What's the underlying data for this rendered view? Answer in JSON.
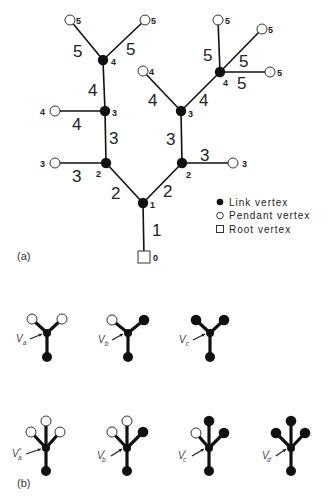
{
  "panel_a": {
    "label": "(a)",
    "legend": [
      {
        "marker": "link-vertex",
        "text": "Link vertex"
      },
      {
        "marker": "pendant-vertex",
        "text": "Pendant vertex"
      },
      {
        "marker": "root-vertex",
        "text": "Root vertex"
      }
    ],
    "vertices": [
      {
        "id": "root",
        "type": "root",
        "x": 144,
        "y": 257,
        "label": "0",
        "lx": 153,
        "ly": 261
      },
      {
        "id": "L1",
        "type": "link",
        "x": 143,
        "y": 203,
        "label": "1",
        "lx": 150,
        "ly": 208
      },
      {
        "id": "L2a",
        "type": "link",
        "x": 106,
        "y": 163,
        "label": "2",
        "lx": 96,
        "ly": 177
      },
      {
        "id": "L2b",
        "type": "link",
        "x": 182,
        "y": 163,
        "label": "2",
        "lx": 186,
        "ly": 178
      },
      {
        "id": "L3a",
        "type": "link",
        "x": 105,
        "y": 111,
        "label": "3",
        "lx": 112,
        "ly": 116
      },
      {
        "id": "L3b",
        "type": "link",
        "x": 181,
        "y": 111,
        "label": "3",
        "lx": 188,
        "ly": 117
      },
      {
        "id": "L4a",
        "type": "link",
        "x": 103,
        "y": 60,
        "label": "4",
        "lx": 111,
        "ly": 65
      },
      {
        "id": "L4b",
        "type": "link",
        "x": 220,
        "y": 72,
        "label": "4",
        "lx": 223,
        "ly": 86
      },
      {
        "id": "P3a",
        "type": "pendant",
        "x": 55,
        "y": 163,
        "label": "3",
        "lx": 40,
        "ly": 167
      },
      {
        "id": "P3b",
        "type": "pendant",
        "x": 233,
        "y": 163,
        "label": "3",
        "lx": 242,
        "ly": 167
      },
      {
        "id": "P4a",
        "type": "pendant",
        "x": 55,
        "y": 111,
        "label": "4",
        "lx": 40,
        "ly": 115
      },
      {
        "id": "P4b",
        "type": "pendant",
        "x": 143,
        "y": 71,
        "label": "4",
        "lx": 149,
        "ly": 75
      },
      {
        "id": "P5a",
        "type": "pendant",
        "x": 70,
        "y": 20,
        "label": "5",
        "lx": 76,
        "ly": 24
      },
      {
        "id": "P5b",
        "type": "pendant",
        "x": 145,
        "y": 20,
        "label": "5",
        "lx": 151,
        "ly": 24
      },
      {
        "id": "P5c",
        "type": "pendant",
        "x": 218,
        "y": 20,
        "label": "5",
        "lx": 225,
        "ly": 24
      },
      {
        "id": "P5d",
        "type": "pendant",
        "x": 262,
        "y": 29,
        "label": "5",
        "lx": 268,
        "ly": 33
      },
      {
        "id": "P5e",
        "type": "pendant",
        "x": 270,
        "y": 72,
        "label": "5",
        "lx": 277,
        "ly": 76
      }
    ],
    "edges": [
      {
        "from": "root",
        "to": "L1",
        "label": "1",
        "lx": 152,
        "ly": 236
      },
      {
        "from": "L1",
        "to": "L2a",
        "label": "2",
        "lx": 111,
        "ly": 199
      },
      {
        "from": "L1",
        "to": "L2b",
        "label": "2",
        "lx": 163,
        "ly": 197
      },
      {
        "from": "L2a",
        "to": "P3a",
        "label": "3",
        "lx": 72,
        "ly": 182
      },
      {
        "from": "L2a",
        "to": "L3a",
        "label": "3",
        "lx": 109,
        "ly": 144
      },
      {
        "from": "L2b",
        "to": "L3b",
        "label": "3",
        "lx": 166,
        "ly": 145
      },
      {
        "from": "L2b",
        "to": "P3b",
        "label": "3",
        "lx": 200,
        "ly": 161
      },
      {
        "from": "L3a",
        "to": "P4a",
        "label": "4",
        "lx": 72,
        "ly": 130
      },
      {
        "from": "L3a",
        "to": "L4a",
        "label": "4",
        "lx": 88,
        "ly": 96
      },
      {
        "from": "L3b",
        "to": "P4b",
        "label": "4",
        "lx": 148,
        "ly": 106
      },
      {
        "from": "L3b",
        "to": "L4b",
        "label": "4",
        "lx": 199,
        "ly": 106
      },
      {
        "from": "L4a",
        "to": "P5a",
        "label": "5",
        "lx": 73,
        "ly": 57
      },
      {
        "from": "L4a",
        "to": "P5b",
        "label": "5",
        "lx": 126,
        "ly": 55
      },
      {
        "from": "L4b",
        "to": "P5c",
        "label": "5",
        "lx": 203,
        "ly": 61
      },
      {
        "from": "L4b",
        "to": "P5d",
        "label": "5",
        "lx": 239,
        "ly": 67
      },
      {
        "from": "L4b",
        "to": "P5e",
        "label": "5",
        "lx": 237,
        "ly": 89
      }
    ]
  },
  "panel_b": {
    "label": "(b)",
    "motifs": [
      {
        "name": "V",
        "sub": "a",
        "prime": "",
        "cx": 47,
        "cy": 333,
        "bottom": 357,
        "lblx": 16,
        "lbly": 342,
        "branches": [
          {
            "x": 32,
            "y": 319,
            "type": "pendant"
          },
          {
            "x": 62,
            "y": 319,
            "type": "pendant"
          }
        ]
      },
      {
        "name": "V",
        "sub": "b",
        "prime": "",
        "cx": 128,
        "cy": 333,
        "bottom": 357,
        "lblx": 98,
        "lbly": 343,
        "branches": [
          {
            "x": 112,
            "y": 320,
            "type": "pendant"
          },
          {
            "x": 144,
            "y": 320,
            "type": "link"
          }
        ]
      },
      {
        "name": "V",
        "sub": "c",
        "prime": "",
        "cx": 210,
        "cy": 333,
        "bottom": 357,
        "lblx": 179,
        "lbly": 343,
        "branches": [
          {
            "x": 196,
            "y": 320,
            "type": "link"
          },
          {
            "x": 224,
            "y": 320,
            "type": "link"
          }
        ]
      },
      {
        "name": "V",
        "sub": "a",
        "prime": "″",
        "cx": 46,
        "cy": 448,
        "bottom": 471,
        "lblx": 12,
        "lbly": 457,
        "branches": [
          {
            "x": 31,
            "y": 432,
            "type": "pendant"
          },
          {
            "x": 46,
            "y": 421,
            "type": "pendant"
          },
          {
            "x": 60,
            "y": 432,
            "type": "pendant"
          }
        ]
      },
      {
        "name": "V",
        "sub": "b",
        "prime": "′",
        "cx": 127,
        "cy": 448,
        "bottom": 471,
        "lblx": 97,
        "lbly": 459,
        "branches": [
          {
            "x": 112,
            "y": 432,
            "type": "pendant"
          },
          {
            "x": 127,
            "y": 421,
            "type": "pendant"
          },
          {
            "x": 143,
            "y": 432,
            "type": "link"
          }
        ]
      },
      {
        "name": "V",
        "sub": "c",
        "prime": "′",
        "cx": 209,
        "cy": 448,
        "bottom": 471,
        "lblx": 178,
        "lbly": 459,
        "branches": [
          {
            "x": 196,
            "y": 433,
            "type": "pendant"
          },
          {
            "x": 209,
            "y": 421,
            "type": "link"
          },
          {
            "x": 224,
            "y": 433,
            "type": "link"
          }
        ]
      },
      {
        "name": "V",
        "sub": "d",
        "prime": "′",
        "cx": 291,
        "cy": 448,
        "bottom": 471,
        "lblx": 262,
        "lbly": 459,
        "branches": [
          {
            "x": 276,
            "y": 433,
            "type": "link"
          },
          {
            "x": 291,
            "y": 421,
            "type": "link"
          },
          {
            "x": 305,
            "y": 433,
            "type": "link"
          }
        ]
      }
    ]
  }
}
